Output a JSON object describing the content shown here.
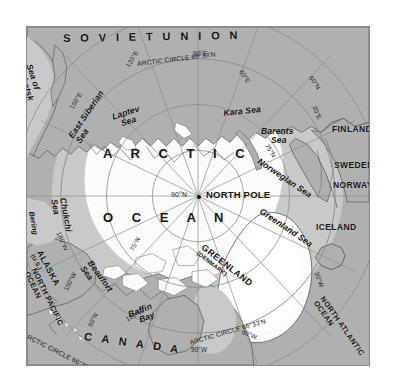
{
  "map": {
    "title": "Arctic Region Polar Projection Map",
    "projection": "azimuthal polar",
    "center_label": "NORTH POLE",
    "center_coord": "90°N",
    "colors": {
      "land": "#b0b0b0",
      "ice": "#fbfbfb",
      "water": "#c9c9c9",
      "border_line": "#555555",
      "graticule": "#8c8c8c",
      "frame": "#8a8a8a",
      "page_background": "#ffffff",
      "text": "#141414"
    },
    "countries": [
      {
        "id": "soviet-union",
        "label": "S O V I E T   U N I O N"
      },
      {
        "id": "canada",
        "label": "C A N A D A"
      },
      {
        "id": "finland",
        "label": "FINLAND"
      },
      {
        "id": "sweden",
        "label": "SWEDEN"
      },
      {
        "id": "norway",
        "label": "NORWAY"
      },
      {
        "id": "iceland",
        "label": "ICELAND"
      },
      {
        "id": "greenland",
        "label": "GREENLAND",
        "sub": "(DENMARK)"
      },
      {
        "id": "alaska",
        "label": "ALASKA",
        "sub": "(U.S.)"
      }
    ],
    "oceans": [
      {
        "id": "arctic-ocean",
        "line1": "A R C T I C",
        "line2": "O C E A N"
      },
      {
        "id": "north-pacific-ocean",
        "line1": "NORTH PACIFIC",
        "line2": "OCEAN"
      },
      {
        "id": "north-atlantic-ocean",
        "line1": "NORTH ATLANTIC",
        "line2": "OCEAN"
      }
    ],
    "seas": [
      {
        "id": "sea-of-okhotsk",
        "line1": "Sea of",
        "line2": "Okhotsk"
      },
      {
        "id": "east-siberian-sea",
        "line1": "East Siberian",
        "line2": "Sea"
      },
      {
        "id": "chukchi-sea",
        "line1": "Chukchi",
        "line2": "Sea"
      },
      {
        "id": "bering-sea",
        "line1": "Bering",
        "line2": "Sea"
      },
      {
        "id": "beaufort-sea",
        "line1": "Beaufort",
        "line2": "Sea"
      },
      {
        "id": "laptev-sea",
        "line1": "Laptev",
        "line2": "Sea"
      },
      {
        "id": "kara-sea",
        "line1": "Kara Sea",
        "line2": ""
      },
      {
        "id": "barents-sea",
        "line1": "Barents",
        "line2": "Sea"
      },
      {
        "id": "norwegian-sea",
        "line1": "Norwegian Sea",
        "line2": ""
      },
      {
        "id": "greenland-sea",
        "line1": "Greenland Sea",
        "line2": ""
      },
      {
        "id": "baffin-bay",
        "line1": "Baffin",
        "line2": "Bay"
      }
    ],
    "graticule_labels": [
      {
        "id": "lon-90e",
        "text": "90°E"
      },
      {
        "id": "lon-120e",
        "text": "120°E"
      },
      {
        "id": "lon-150e",
        "text": "150°E"
      },
      {
        "id": "lon-60e",
        "text": "60°E"
      },
      {
        "id": "lon-30e",
        "text": "30°E"
      },
      {
        "id": "lon-180w",
        "text": "180°W"
      },
      {
        "id": "lon-150w",
        "text": "150°W"
      },
      {
        "id": "lon-120w",
        "text": "120°W"
      },
      {
        "id": "lon-90w",
        "text": "90°W"
      },
      {
        "id": "lon-60w",
        "text": "60°W"
      },
      {
        "id": "lon-30w",
        "text": "30°W"
      },
      {
        "id": "lat-60n-east",
        "text": "60°N"
      },
      {
        "id": "lat-60n-west",
        "text": "60°N"
      },
      {
        "id": "lat-75n-east",
        "text": "75°N"
      },
      {
        "id": "lat-75n-west",
        "text": "75°N"
      },
      {
        "id": "lat-90n",
        "text": "90°N"
      },
      {
        "id": "arctic-circle-top",
        "text": "ARCTIC CIRCLE  66°33'N"
      },
      {
        "id": "arctic-circle-bottom",
        "text": "ARCTIC CIRCLE  66°33'N"
      }
    ]
  }
}
